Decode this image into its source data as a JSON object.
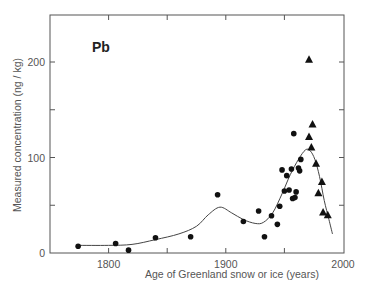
{
  "chart_data": {
    "type": "scatter",
    "title": "",
    "panel_label": "Pb",
    "xlabel": "Age of Greenland snow or ice (years)",
    "ylabel": "Measured concentration  (ng / kg)",
    "xlim": [
      1750,
      2000
    ],
    "ylim": [
      0,
      250
    ],
    "x_ticks": [
      1800,
      1900,
      2000
    ],
    "x_minor_ticks": [
      1750,
      1800,
      1850,
      1900,
      1950,
      2000
    ],
    "y_ticks": [
      0,
      100,
      200
    ],
    "y_minor_ticks": [
      0,
      50,
      100,
      150,
      200,
      250
    ],
    "grid": false,
    "legend": null,
    "series": [
      {
        "name": "circles",
        "marker": "circle",
        "points": [
          [
            1774,
            7
          ],
          [
            1806,
            10
          ],
          [
            1817,
            3
          ],
          [
            1840,
            16
          ],
          [
            1870,
            17
          ],
          [
            1893,
            61
          ],
          [
            1915,
            33
          ],
          [
            1928,
            44
          ],
          [
            1933,
            17
          ],
          [
            1939,
            39
          ],
          [
            1944,
            30
          ],
          [
            1946,
            49
          ],
          [
            1948,
            87
          ],
          [
            1950,
            65
          ],
          [
            1952,
            81
          ],
          [
            1954,
            66
          ],
          [
            1956,
            88
          ],
          [
            1957,
            57
          ],
          [
            1958,
            125
          ],
          [
            1959,
            58
          ],
          [
            1960,
            64
          ],
          [
            1962,
            89
          ],
          [
            1963,
            86
          ],
          [
            1964,
            98
          ]
        ]
      },
      {
        "name": "triangles",
        "marker": "triangle",
        "points": [
          [
            1971,
            203
          ],
          [
            1974,
            135
          ],
          [
            1971,
            122
          ],
          [
            1973,
            111
          ],
          [
            1977,
            94
          ],
          [
            1979,
            63
          ],
          [
            1982,
            75
          ],
          [
            1983,
            43
          ],
          [
            1987,
            40
          ]
        ]
      },
      {
        "name": "smoothed trend",
        "marker": "line",
        "points": [
          [
            1773,
            8
          ],
          [
            1800,
            8
          ],
          [
            1820,
            9
          ],
          [
            1840,
            14
          ],
          [
            1860,
            20
          ],
          [
            1875,
            28
          ],
          [
            1885,
            40
          ],
          [
            1895,
            48
          ],
          [
            1905,
            42
          ],
          [
            1915,
            35
          ],
          [
            1925,
            31
          ],
          [
            1932,
            32
          ],
          [
            1940,
            42
          ],
          [
            1948,
            62
          ],
          [
            1955,
            82
          ],
          [
            1962,
            98
          ],
          [
            1968,
            108
          ],
          [
            1972,
            107
          ],
          [
            1976,
            98
          ],
          [
            1980,
            80
          ],
          [
            1984,
            55
          ],
          [
            1988,
            35
          ],
          [
            1991,
            20
          ]
        ]
      }
    ]
  }
}
